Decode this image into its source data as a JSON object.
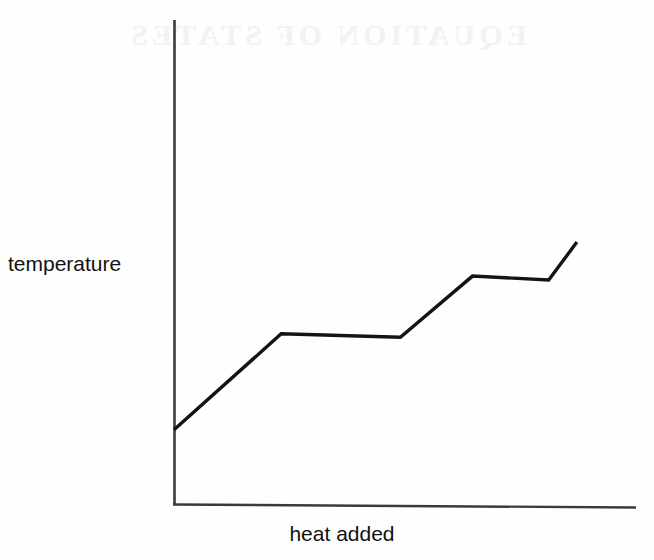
{
  "figure": {
    "name": "heating-curve",
    "background_color": "#fefefe",
    "line_color": "#141414",
    "axis_color": "#3a3a3a",
    "ghost_text": "EQUATION OF STATES"
  },
  "axes": {
    "y_label": "temperature",
    "x_label": "heat added"
  },
  "chart_data": {
    "type": "line",
    "title": "",
    "xlabel": "heat added",
    "ylabel": "temperature",
    "grid": false,
    "legend": false,
    "x_ticks": [],
    "y_ticks": [],
    "xlim": [
      0,
      100
    ],
    "ylim": [
      0,
      100
    ],
    "series": [
      {
        "name": "heating curve",
        "x": [
          0,
          23.2,
          49.0,
          64.6,
          81.1,
          87.2
        ],
        "y": [
          15.5,
          35.3,
          34.6,
          47.2,
          46.4,
          54.2
        ],
        "points": [
          {
            "x": 0,
            "y": 15.5,
            "segment": "solid heating"
          },
          {
            "x": 23.2,
            "y": 35.3,
            "segment": "melting plateau start"
          },
          {
            "x": 49.0,
            "y": 34.6,
            "segment": "melting plateau end"
          },
          {
            "x": 64.6,
            "y": 47.2,
            "segment": "liquid heating"
          },
          {
            "x": 81.1,
            "y": 46.4,
            "segment": "boiling plateau end"
          },
          {
            "x": 87.2,
            "y": 54.2,
            "segment": "gas heating"
          }
        ]
      }
    ]
  }
}
